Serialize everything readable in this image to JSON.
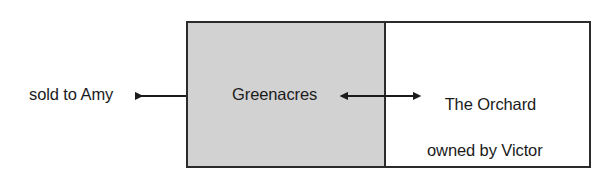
{
  "figure": {
    "type": "land-parcel-diagram",
    "width": 613,
    "height": 183,
    "background_color": "#ffffff",
    "border_color": "#2b2b2b",
    "text_color": "#1b1b1b"
  },
  "parcel": {
    "left_section": {
      "label": "Greenacres",
      "fill_color": "#d2d2d2",
      "shaded": true
    },
    "right_section": {
      "label_line1": "The Orchard",
      "label_line2": "owned by Victor",
      "fill_color": "#ffffff",
      "shaded": false
    }
  },
  "annotations": {
    "left_label": "sold to Amy"
  },
  "arrows": {
    "sold_arrow": {
      "direction": "left",
      "from_x": 186,
      "to_x": 128,
      "y": 96,
      "color": "#1b1b1b"
    },
    "boundary_arrow": {
      "direction": "both",
      "from_x": 340,
      "to_x": 421,
      "y": 96,
      "color": "#1b1b1b"
    }
  }
}
